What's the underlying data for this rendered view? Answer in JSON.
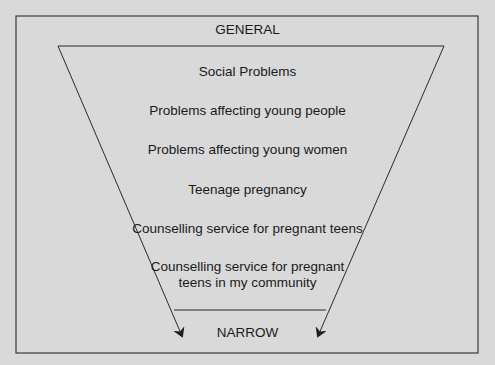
{
  "diagram": {
    "type": "funnel",
    "top_label": "GENERAL",
    "bottom_label": "NARROW",
    "levels": [
      "Social Problems",
      "Problems affecting young people",
      "Problems affecting young women",
      "Teenage pregnancy",
      "Counselling service for pregnant teens",
      "Counselling service for pregnant teens in my community"
    ],
    "colors": {
      "background": "#d9d9d9",
      "stroke": "#2b2b2b",
      "text": "#1a1a1a"
    }
  }
}
